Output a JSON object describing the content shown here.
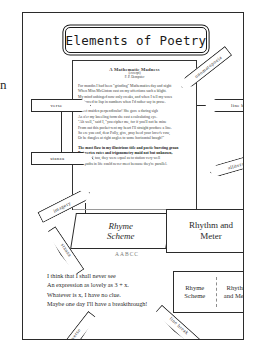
{
  "document": {
    "title": "Elements of Poetry"
  },
  "poem": {
    "title": "A Mathematic Madness",
    "subtitle": "(excerpt)",
    "author": "F. P. Dempster",
    "stanza1": [
      "For months I had been \"grinding\" Mathematics day and night",
      "When Miss McGinton cast on my affections such a blight.",
      "My mind unhinged now only creaks, and when I tell my woes",
      "I'm forced to lisp in numbers when I'd rather say in prose."
    ],
    "stanza2": [
      "Sweet maiden perpendicular! She gave a daring sigh",
      "As o'er my kneeling form she cast a calculating eye.",
      "\"Ah well,\" said I, \"you cipher me, for if you'll not be mine",
      "From out this pocket-rent my heart I'll straight produce a line.",
      "So ere you end, dear Polly, give, pray heed your lover's vow,",
      "Or he dangles at right angles to some horizontal bough!\""
    ],
    "stanza3": [
      "The most flaw in my illustrious title and poetic bursting groan",
      "But vertex rates and trigonometry maid not but unknown,",
      "And lived, too, they were equal as to station very well",
      "Our paths in life could never meet because they're parallel."
    ]
  },
  "poem2": {
    "lines": [
      "I think that I shall never see",
      "An expression as lovely as 3 + x.",
      "Whatever is x, I have no clue.",
      "Maybe one day I'll have a breakthrough!"
    ]
  },
  "callouts": {
    "verse": "verse",
    "line_break": "line break",
    "stanza": "stanza",
    "onomatopoeia": "onomatopoeia",
    "alliteration": "alliteration",
    "imagery": "imagery",
    "stanza_bottom": "stanza",
    "verse_bottom": "verse",
    "line_break_bottom": "line break"
  },
  "boxes": {
    "rhyme_scheme_line1": "Rhyme",
    "rhyme_scheme_line2": "Scheme",
    "rhyme_code": "AABCC",
    "rhythm_line1": "Rhythm and",
    "rhythm_line2": "Meter",
    "bottom_rhyme_line1": "Rhyme",
    "bottom_rhyme_line2": "Scheme",
    "bottom_rhythm_line1": "Rhythm",
    "bottom_rhythm_line2": "and Meter"
  },
  "edge": {
    "glyph": "n"
  }
}
